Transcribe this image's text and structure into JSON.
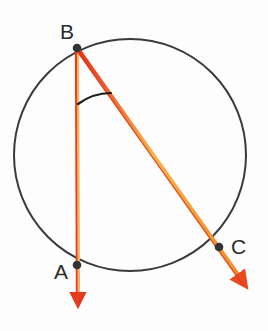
{
  "figure": {
    "background_color": "#fdfdfd",
    "width": 268,
    "height": 331
  },
  "labels": {
    "a": "A",
    "b": "B",
    "c": "C"
  },
  "colors": {
    "ray_core": "#f5a623",
    "ray_edge": "#e8341c",
    "circle_stroke": "#3a3a3a",
    "point_fill": "#333333",
    "arc_stroke": "#1c1c1c",
    "label_color": "#2b2b2b"
  },
  "chart_data": {
    "type": "diagram",
    "shape": "circle-with-inscribed-angle",
    "circle": {
      "cx": 130,
      "cy": 155,
      "r": 116,
      "stroke_width": 2
    },
    "points": [
      {
        "name": "B",
        "x": 77,
        "y": 48,
        "role": "angle-vertex",
        "label_x": 60,
        "label_y": 21
      },
      {
        "name": "A",
        "x": 77,
        "y": 265,
        "role": "circle-intersection",
        "label_x": 54,
        "label_y": 261
      },
      {
        "name": "C",
        "x": 219,
        "y": 247,
        "role": "circle-intersection",
        "label_x": 231,
        "label_y": 236
      }
    ],
    "rays": [
      {
        "name": "ray-BA",
        "from": "B",
        "x1": 77,
        "y1": 48,
        "x2": 78,
        "y2": 312,
        "through": "A",
        "arrowhead": true
      },
      {
        "name": "ray-BC",
        "from": "B",
        "x1": 77,
        "y1": 48,
        "x2": 251,
        "y2": 293,
        "through": "C",
        "arrowhead": true
      }
    ],
    "angle_arc": {
      "vertex": "B",
      "radius": 56,
      "start_x": 78,
      "start_y": 104,
      "end_x": 111,
      "end_y": 93
    }
  }
}
